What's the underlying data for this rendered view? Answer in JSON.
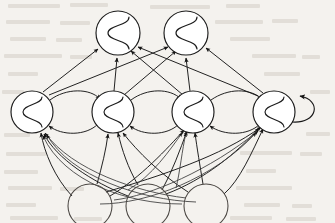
{
  "figure": {
    "name": "recurrent-neural-network-diagram",
    "title": "",
    "caption": "",
    "background_color": "#f4f2ee",
    "ink_color": "#171717",
    "node_fill": "#ffffff",
    "width": 335,
    "height": 223
  },
  "diagram_data": {
    "type": "node-link-graph",
    "graph_kind": "recurrent-neural-network",
    "directed": true,
    "layers": [
      {
        "id": "output",
        "name": "output-layer",
        "role": "output",
        "count": 2,
        "glyph": "sigmoid",
        "radius": 22,
        "y": 33
      },
      {
        "id": "hidden",
        "name": "hidden-layer",
        "role": "hidden-recurrent",
        "count": 4,
        "glyph": "sigmoid",
        "radius": 21,
        "y": 112
      },
      {
        "id": "input",
        "name": "input-layer",
        "role": "input",
        "count": 3,
        "glyph": "none",
        "radius": 22,
        "y": 206
      }
    ],
    "nodes": [
      {
        "id": "o1",
        "layer": "output",
        "label": "",
        "cx": 118,
        "cy": 33,
        "r": 22,
        "glyph": "sigmoid"
      },
      {
        "id": "o2",
        "layer": "output",
        "label": "",
        "cx": 186,
        "cy": 33,
        "r": 22,
        "glyph": "sigmoid"
      },
      {
        "id": "h1",
        "layer": "hidden",
        "label": "",
        "cx": 32,
        "cy": 112,
        "r": 21,
        "glyph": "sigmoid"
      },
      {
        "id": "h2",
        "layer": "hidden",
        "label": "",
        "cx": 113,
        "cy": 112,
        "r": 21,
        "glyph": "sigmoid"
      },
      {
        "id": "h3",
        "layer": "hidden",
        "label": "",
        "cx": 193,
        "cy": 112,
        "r": 21,
        "glyph": "sigmoid"
      },
      {
        "id": "h4",
        "layer": "hidden",
        "label": "",
        "cx": 274,
        "cy": 112,
        "r": 21,
        "glyph": "sigmoid"
      },
      {
        "id": "i1",
        "layer": "input",
        "label": "",
        "cx": 90,
        "cy": 206,
        "r": 22,
        "glyph": "none"
      },
      {
        "id": "i2",
        "layer": "input",
        "label": "",
        "cx": 148,
        "cy": 206,
        "r": 22,
        "glyph": "none"
      },
      {
        "id": "i3",
        "layer": "input",
        "label": "",
        "cx": 206,
        "cy": 206,
        "r": 22,
        "glyph": "none"
      }
    ],
    "edge_groups": [
      {
        "id": "input-to-hidden",
        "name": "input-to-hidden-edges",
        "style": "straight-and-curved",
        "arrowhead": true,
        "description": "fully connected, 3 inputs x 4 hidden units",
        "count": 12
      },
      {
        "id": "hidden-to-output",
        "name": "hidden-to-output-edges",
        "style": "straight",
        "arrowhead": true,
        "description": "fully connected, 4 hidden units x 2 outputs",
        "count": 8
      },
      {
        "id": "hidden-lateral",
        "name": "hidden-lateral-recurrent-edges",
        "style": "arc",
        "arrowhead": true,
        "description": "bidirectional arcs between adjacent hidden units",
        "count": 6
      },
      {
        "id": "hidden-self",
        "name": "hidden-self-loop-edge",
        "style": "loop",
        "arrowhead": true,
        "description": "self recurrent loop on rightmost hidden unit",
        "count": 1
      }
    ],
    "edges": [
      {
        "from": "i1",
        "to": "h1",
        "group": "input-to-hidden"
      },
      {
        "from": "i1",
        "to": "h2",
        "group": "input-to-hidden"
      },
      {
        "from": "i1",
        "to": "h3",
        "group": "input-to-hidden"
      },
      {
        "from": "i1",
        "to": "h4",
        "group": "input-to-hidden"
      },
      {
        "from": "i2",
        "to": "h1",
        "group": "input-to-hidden"
      },
      {
        "from": "i2",
        "to": "h2",
        "group": "input-to-hidden"
      },
      {
        "from": "i2",
        "to": "h3",
        "group": "input-to-hidden"
      },
      {
        "from": "i2",
        "to": "h4",
        "group": "input-to-hidden"
      },
      {
        "from": "i3",
        "to": "h1",
        "group": "input-to-hidden"
      },
      {
        "from": "i3",
        "to": "h2",
        "group": "input-to-hidden"
      },
      {
        "from": "i3",
        "to": "h3",
        "group": "input-to-hidden"
      },
      {
        "from": "i3",
        "to": "h4",
        "group": "input-to-hidden"
      },
      {
        "from": "h1",
        "to": "o1",
        "group": "hidden-to-output"
      },
      {
        "from": "h1",
        "to": "o2",
        "group": "hidden-to-output"
      },
      {
        "from": "h2",
        "to": "o1",
        "group": "hidden-to-output"
      },
      {
        "from": "h2",
        "to": "o2",
        "group": "hidden-to-output"
      },
      {
        "from": "h3",
        "to": "o1",
        "group": "hidden-to-output"
      },
      {
        "from": "h3",
        "to": "o2",
        "group": "hidden-to-output"
      },
      {
        "from": "h4",
        "to": "o1",
        "group": "hidden-to-output"
      },
      {
        "from": "h4",
        "to": "o2",
        "group": "hidden-to-output"
      },
      {
        "from": "h1",
        "to": "h2",
        "group": "hidden-lateral"
      },
      {
        "from": "h2",
        "to": "h1",
        "group": "hidden-lateral"
      },
      {
        "from": "h2",
        "to": "h3",
        "group": "hidden-lateral"
      },
      {
        "from": "h3",
        "to": "h2",
        "group": "hidden-lateral"
      },
      {
        "from": "h3",
        "to": "h4",
        "group": "hidden-lateral"
      },
      {
        "from": "h4",
        "to": "h3",
        "group": "hidden-lateral"
      },
      {
        "from": "h4",
        "to": "h4",
        "group": "hidden-self"
      }
    ]
  }
}
